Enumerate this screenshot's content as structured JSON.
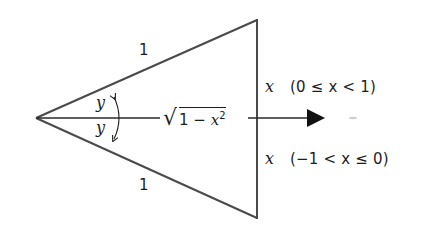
{
  "diagram": {
    "type": "triangle-angle-figure",
    "colors": {
      "stroke": "#4a4a4a",
      "text": "#1e1e1e",
      "arrow": "#111111",
      "background": "#ffffff"
    },
    "geometry": {
      "apex": [
        36,
        118
      ],
      "top_vertex": [
        257,
        20
      ],
      "bottom_vertex": [
        257,
        218
      ],
      "axis_end": [
        324,
        118
      ]
    },
    "labels": {
      "top_side": "1",
      "bottom_side": "1",
      "angle_upper": "y",
      "angle_lower": "y",
      "median_radicand_prefix": "1 − ",
      "median_var": "x",
      "median_exponent": "2",
      "right_upper_var": "x",
      "right_upper_condition": "(0 ≤ x < 1)",
      "right_lower_var": "x",
      "right_lower_condition": "(−1 < x ≤ 0)"
    },
    "icons": {
      "arrowhead": "filled-triangle-right",
      "angle_arc": "double-headed-curved-arrow"
    }
  }
}
